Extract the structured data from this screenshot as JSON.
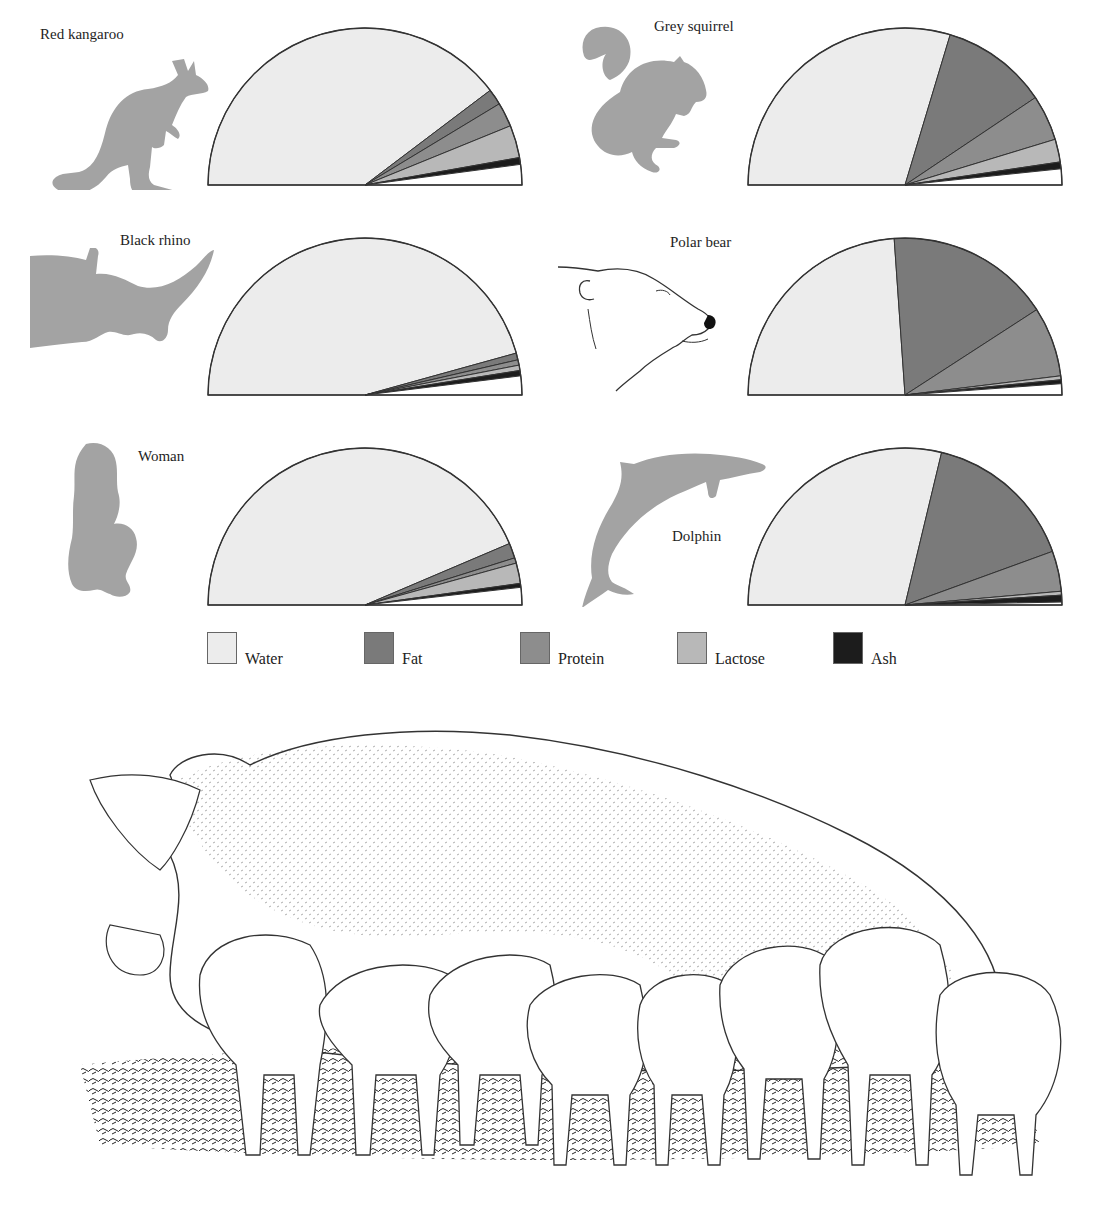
{
  "chart_data": {
    "type": "pie",
    "subtype": "semicircle",
    "title": "",
    "legend": {
      "position": "bottom",
      "entries": [
        {
          "name": "Water",
          "color": "#ececec"
        },
        {
          "name": "Fat",
          "color": "#7a7a7a"
        },
        {
          "name": "Protein",
          "color": "#8d8d8d"
        },
        {
          "name": "Lactose",
          "color": "#b8b8b8"
        },
        {
          "name": "Ash",
          "color": "#1c1c1c"
        }
      ]
    },
    "categories": [
      "Water",
      "Fat",
      "Protein",
      "Lactose",
      "Ash",
      "Other"
    ],
    "units": "percent of milk composition (approx., read from semicircle angles)",
    "series": [
      {
        "name": "Red kangaroo",
        "values": [
          79.4,
          3.3,
          5.0,
          6.7,
          1.4,
          4.2
        ]
      },
      {
        "name": "Grey squirrel",
        "values": [
          59.3,
          21.9,
          9.4,
          4.7,
          1.4,
          3.3
        ]
      },
      {
        "name": "Black rhino",
        "values": [
          91.4,
          1.4,
          1.1,
          1.1,
          1.1,
          3.9
        ]
      },
      {
        "name": "Polar bear",
        "values": [
          47.8,
          33.9,
          14.4,
          0.8,
          0.8,
          2.3
        ]
      },
      {
        "name": "Woman",
        "values": [
          87.2,
          3.1,
          1.1,
          4.2,
          0.8,
          3.6
        ]
      },
      {
        "name": "Dolphin",
        "values": [
          57.5,
          31.4,
          8.3,
          0.8,
          1.4,
          0.6
        ]
      }
    ]
  },
  "panels": [
    {
      "label": "Red kangaroo",
      "icon": "kangaroo-silhouette"
    },
    {
      "label": "Grey squirrel",
      "icon": "squirrel-silhouette"
    },
    {
      "label": "Black rhino",
      "icon": "rhino-silhouette"
    },
    {
      "label": "Polar bear",
      "icon": "polar-bear-drawing"
    },
    {
      "label": "Woman",
      "icon": "woman-silhouette"
    },
    {
      "label": "Dolphin",
      "icon": "dolphin-silhouette"
    }
  ],
  "legend": {
    "water": "Water",
    "fat": "Fat",
    "protein": "Protein",
    "lactose": "Lactose",
    "ash": "Ash"
  },
  "colors": {
    "water": "#ececec",
    "fat": "#7a7a7a",
    "protein": "#8d8d8d",
    "lactose": "#b8b8b8",
    "ash": "#1c1c1c",
    "other": "#ffffff",
    "silhouette": "#a3a3a3",
    "outline": "#333333"
  },
  "illustration": {
    "subject": "sow-nursing-piglets",
    "piglet_count": 8
  }
}
